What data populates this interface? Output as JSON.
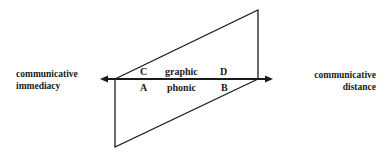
{
  "diagram": {
    "left_label": {
      "line1": "communicative",
      "line2": "immediacy"
    },
    "right_label": {
      "line1": "communicative",
      "line2": "distance"
    },
    "upper_row": {
      "left": "C",
      "middle": "graphic",
      "right": "D"
    },
    "lower_row": {
      "left": "A",
      "middle": "phonic",
      "right": "B"
    },
    "colors": {
      "line": "#1a1a1a",
      "background": "#ffffff"
    }
  }
}
